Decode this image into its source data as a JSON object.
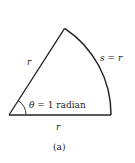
{
  "figure": {
    "caption": "(a)",
    "labels": {
      "side_left": "r",
      "side_bottom": "r",
      "arc": "s = r",
      "angle_symbol": "θ",
      "angle_text": " = 1 radian"
    },
    "geometry": {
      "vertex": [
        9,
        115
      ],
      "radius": 103,
      "angle_radians": 1
    },
    "colors": {
      "stroke": "#222222",
      "background": "#ffffff"
    }
  }
}
